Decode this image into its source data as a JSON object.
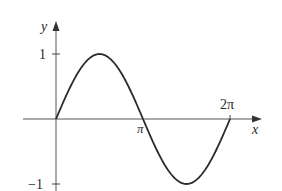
{
  "chart_data": {
    "type": "line",
    "title": "",
    "function": "y = sin(x)",
    "xlabel": "x",
    "ylabel": "y",
    "x_ticks": [
      {
        "value": 3.14159,
        "label": "π"
      },
      {
        "value": 6.28318,
        "label": "2π"
      }
    ],
    "y_ticks": [
      {
        "value": 1,
        "label": "1"
      },
      {
        "value": -1,
        "label": "−1"
      }
    ],
    "xlim": [
      0,
      6.28318
    ],
    "ylim": [
      -1,
      1
    ],
    "grid": false,
    "legend": null,
    "series": [
      {
        "name": "sin x",
        "x": [
          0,
          0.7854,
          1.5708,
          2.3562,
          3.1416,
          3.927,
          4.7124,
          5.4978,
          6.2832
        ],
        "values": [
          0,
          0.707,
          1,
          0.707,
          0,
          -0.707,
          -1,
          -0.707,
          0
        ]
      }
    ],
    "colors": {
      "curve": "#2b2b2b",
      "axis": "#555555",
      "text": "#2a2a2a"
    }
  },
  "labels": {
    "y_axis": "y",
    "x_axis": "x",
    "tick_one": "1",
    "tick_neg_one": "−1",
    "tick_pi": "π",
    "tick_two_pi": "2π"
  }
}
